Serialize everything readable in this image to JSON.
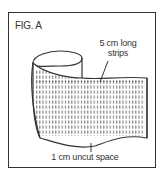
{
  "figure": {
    "label": "FIG. A",
    "callouts": {
      "strips_line1": "5 cm long",
      "strips_line2": "strips",
      "uncut": "1 cm uncut space"
    }
  },
  "colors": {
    "ink": "#333333",
    "background": "#ffffff"
  }
}
